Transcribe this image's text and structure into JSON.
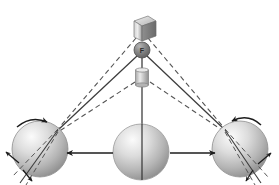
{
  "diagram": {
    "type": "physics-mechanics-illustration",
    "background_color": "#ffffff",
    "colors": {
      "line_solid": "#3c3c3c",
      "line_dashed": "#555555",
      "arrow": "#1c1c1c",
      "sphere_light": "#f2f2f2",
      "sphere_mid": "#b8b8b8",
      "sphere_dark": "#7a7a7a",
      "apex_sphere_dark": "#6e6e6e",
      "box_light": "#e6e6e6",
      "box_mid": "#9a9a9a",
      "box_dark": "#6b6b6b",
      "label_text": "#2b2b2b"
    },
    "nodes": [
      {
        "name": "top-cube",
        "shape": "cube",
        "label": "",
        "x": 141,
        "y": 21,
        "width": 20,
        "height": 20
      },
      {
        "name": "apex-sphere",
        "shape": "sphere",
        "label": "F",
        "x": 142,
        "y": 50,
        "radius": 8
      },
      {
        "name": "middle-cylinder",
        "shape": "cylinder",
        "label": "",
        "x": 142,
        "y": 76,
        "width": 13,
        "height": 16
      },
      {
        "name": "left-sphere",
        "shape": "sphere",
        "label": "",
        "x": 40,
        "y": 149,
        "radius": 28
      },
      {
        "name": "center-sphere",
        "shape": "sphere",
        "label": "",
        "x": 141,
        "y": 152,
        "radius": 28
      },
      {
        "name": "right-sphere",
        "shape": "sphere",
        "label": "",
        "x": 240,
        "y": 149,
        "radius": 28
      }
    ],
    "cables": [
      {
        "name": "cable-cube-to-left",
        "from": "top-cube",
        "to": "left-contact",
        "style": "dashed"
      },
      {
        "name": "cable-cube-to-right",
        "from": "top-cube",
        "to": "right-contact",
        "style": "dashed"
      },
      {
        "name": "cable-apex-to-left",
        "from": "apex-sphere",
        "to": "left-contact",
        "style": "solid"
      },
      {
        "name": "cable-apex-to-right",
        "from": "apex-sphere",
        "to": "right-contact",
        "style": "solid"
      },
      {
        "name": "cable-cylinder-to-left",
        "from": "middle-cylinder",
        "to": "left-contact",
        "style": "dashed"
      },
      {
        "name": "cable-cylinder-to-right",
        "from": "middle-cylinder",
        "to": "right-contact",
        "style": "dashed"
      },
      {
        "name": "cable-vertical-center",
        "from": "middle-cylinder",
        "to": "center-sphere",
        "style": "solid"
      }
    ],
    "arrows": [
      {
        "name": "arrow-left-translation",
        "direction": "left",
        "type": "straight"
      },
      {
        "name": "arrow-right-translation",
        "direction": "right",
        "type": "straight"
      },
      {
        "name": "arrow-left-rotation",
        "direction": "clockwise",
        "type": "curved"
      },
      {
        "name": "arrow-right-rotation",
        "direction": "counterclockwise",
        "type": "curved"
      },
      {
        "name": "arrow-left-lower-outward",
        "direction": "down-left",
        "type": "straight"
      },
      {
        "name": "arrow-left-upper-outward",
        "direction": "up-left",
        "type": "straight"
      },
      {
        "name": "arrow-right-lower-outward",
        "direction": "down-right",
        "type": "straight"
      },
      {
        "name": "arrow-right-upper-outward",
        "direction": "up-right",
        "type": "straight"
      }
    ]
  }
}
